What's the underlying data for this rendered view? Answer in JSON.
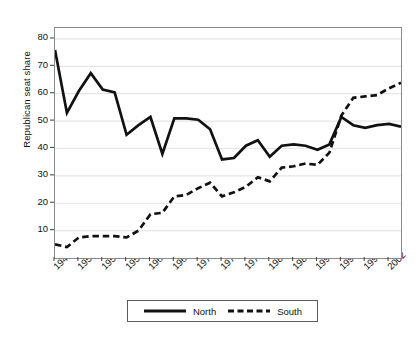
{
  "chart_data": {
    "type": "line",
    "title": "",
    "subtitle": "",
    "xlabel": "",
    "ylabel": "Republican seat share",
    "xlim": [
      1946,
      2004
    ],
    "ylim": [
      0,
      84
    ],
    "grid": true,
    "grid_axis": "y",
    "legend_position": "bottom-center",
    "y_ticks": [
      10,
      20,
      30,
      40,
      50,
      60,
      70,
      80
    ],
    "x_ticks": [
      "1946",
      "1950",
      "1954",
      "1958",
      "1962",
      "1966",
      "1970",
      "1974",
      "1978",
      "1982",
      "1986",
      "1990",
      "1994",
      "1998",
      "2002"
    ],
    "x": [
      1946,
      1948,
      1950,
      1952,
      1954,
      1956,
      1958,
      1960,
      1962,
      1964,
      1966,
      1968,
      1970,
      1972,
      1974,
      1976,
      1978,
      1980,
      1982,
      1984,
      1986,
      1988,
      1990,
      1992,
      1994,
      1996,
      1998,
      2000,
      2002,
      2004
    ],
    "series": [
      {
        "name": "North",
        "style": "solid",
        "color": "#111111",
        "values": [
          76,
          53,
          61,
          67.5,
          61.5,
          60.5,
          45,
          48.5,
          51.5,
          38,
          51,
          51,
          50.5,
          47,
          36,
          36.5,
          41,
          43,
          37,
          41,
          41.5,
          41,
          39.5,
          41.5,
          51.5,
          48.5,
          47.5,
          48.5,
          49,
          48
        ]
      },
      {
        "name": "South",
        "style": "dashed",
        "color": "#111111",
        "values": [
          5,
          4,
          7.5,
          8,
          8,
          8,
          7.5,
          10,
          16,
          16.5,
          22.5,
          23,
          25.5,
          27.5,
          22.5,
          24,
          26,
          29.5,
          28,
          33,
          33.5,
          34.5,
          34,
          38.5,
          52,
          58.5,
          59,
          59.5,
          62,
          64
        ]
      }
    ],
    "legend": [
      {
        "label": "North",
        "style": "solid"
      },
      {
        "label": "South",
        "style": "dashed"
      }
    ]
  }
}
